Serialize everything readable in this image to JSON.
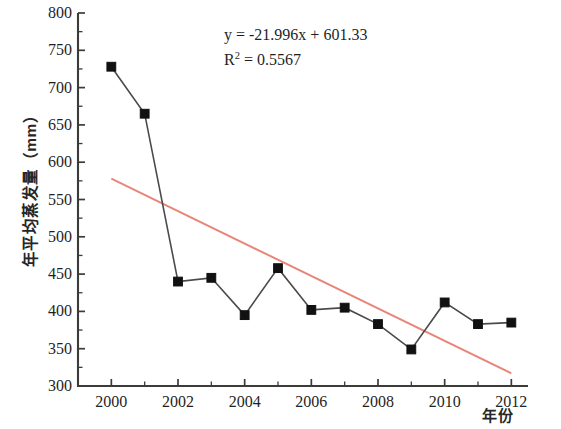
{
  "chart_data": {
    "type": "line",
    "title": "",
    "xlabel": "年份",
    "ylabel": "年平均蒸发量（mm）",
    "xlim": [
      1999,
      2012.5
    ],
    "ylim": [
      300,
      800
    ],
    "grid": false,
    "legend": null,
    "x": [
      2000,
      2001,
      2002,
      2003,
      2004,
      2005,
      2006,
      2007,
      2008,
      2009,
      2010,
      2011,
      2012
    ],
    "xtick_labels": [
      "2000",
      "2002",
      "2004",
      "2006",
      "2008",
      "2010",
      "2012"
    ],
    "xticks": [
      2000,
      2002,
      2004,
      2006,
      2008,
      2010,
      2012
    ],
    "ytick_labels": [
      "300",
      "350",
      "400",
      "450",
      "500",
      "550",
      "600",
      "650",
      "700",
      "750",
      "800"
    ],
    "yticks": [
      300,
      350,
      400,
      450,
      500,
      550,
      600,
      650,
      700,
      750,
      800
    ],
    "series": [
      {
        "name": "年平均蒸发量",
        "marker": "square",
        "marker_color": "#111111",
        "line_color": "#4a4a48",
        "values": [
          728,
          665,
          440,
          445,
          395,
          458,
          402,
          405,
          383,
          349,
          412,
          383,
          385
        ]
      },
      {
        "name": "线性趋势线",
        "type": "trendline",
        "line_color": "#e8867a",
        "endpoints": [
          [
            2000,
            578
          ],
          [
            2012,
            317
          ]
        ]
      }
    ],
    "annotations": {
      "equation": "y = -21.996x + 601.33",
      "r_squared_label": "R",
      "r_squared_exponent": "2",
      "r_squared_value": " = 0.5567",
      "slope": -21.996,
      "intercept": 601.33,
      "r2": 0.5567
    }
  }
}
